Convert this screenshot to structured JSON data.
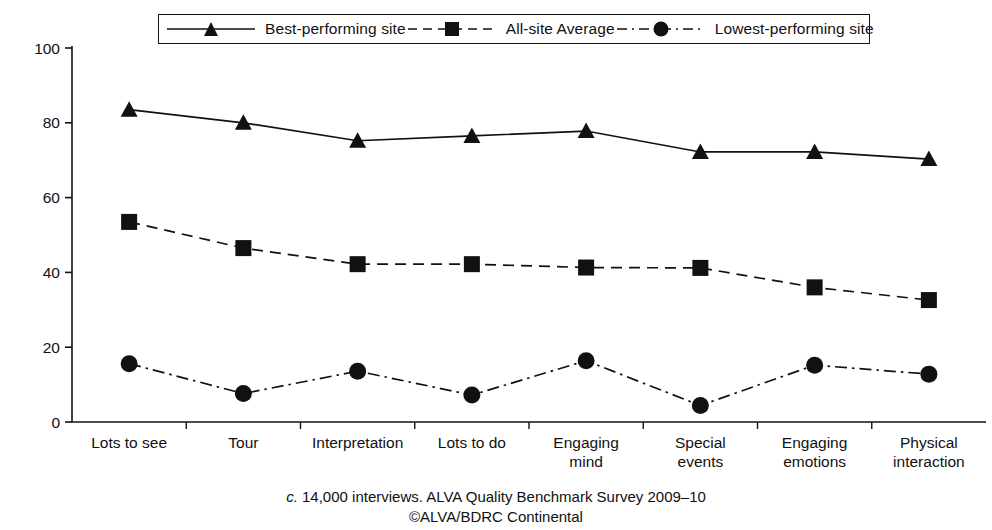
{
  "chart_data": {
    "type": "line",
    "title": "",
    "xlabel": "",
    "ylabel": "",
    "ylim": [
      0,
      100
    ],
    "yticks": [
      0,
      20,
      40,
      60,
      80,
      100
    ],
    "grid": false,
    "legend_position": "top",
    "categories": [
      "Lots to see",
      "Tour",
      "Interpretation",
      "Lots to do",
      "Engaging mind",
      "Special events",
      "Engaging emotions",
      "Physical interaction"
    ],
    "series": [
      {
        "name": "Best-performing site",
        "marker": "triangle",
        "linestyle": "solid",
        "values": [
          83.5,
          80.0,
          75.2,
          76.5,
          77.8,
          72.2,
          72.2,
          70.3
        ]
      },
      {
        "name": "All-site Average",
        "marker": "square",
        "linestyle": "dashed",
        "values": [
          53.5,
          46.5,
          42.2,
          42.2,
          41.3,
          41.2,
          36.0,
          32.6
        ]
      },
      {
        "name": "Lowest-performing site",
        "marker": "circle",
        "linestyle": "dashdot",
        "values": [
          15.6,
          7.6,
          13.6,
          7.2,
          16.4,
          4.4,
          15.2,
          12.8
        ]
      }
    ],
    "annotations": [
      "c. 14,000 interviews. ALVA Quality Benchmark Survey 2009–10",
      "©ALVA/BDRC Continental"
    ]
  },
  "legend": {
    "items": [
      {
        "label": "Best-performing site",
        "marker": "triangle-marker-icon",
        "linestyle": "solid"
      },
      {
        "label": "All-site Average",
        "marker": "square-marker-icon",
        "linestyle": "dashed"
      },
      {
        "label": "Lowest-performing site",
        "marker": "circle-marker-icon",
        "linestyle": "dashdot"
      }
    ]
  },
  "caption": {
    "prefix": "c.",
    "line1": "14,000 interviews. ALVA Quality Benchmark Survey 2009–10",
    "line2": "©ALVA/BDRC Continental"
  },
  "colors": {
    "ink": "#111111",
    "background": "#ffffff"
  }
}
